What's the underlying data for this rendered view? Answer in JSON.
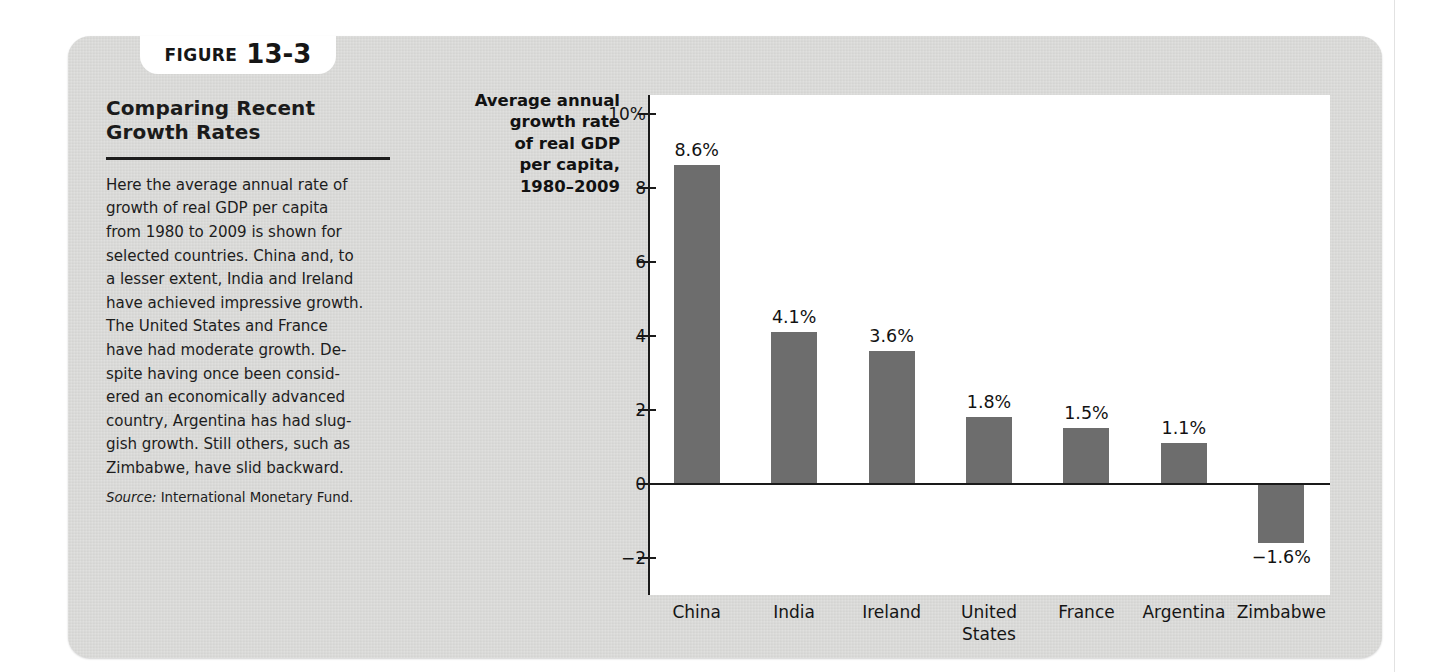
{
  "figure": {
    "tab_word": "FIGURE",
    "tab_number": "13-3",
    "title": "Comparing Recent\nGrowth Rates",
    "body": "Here the average annual rate of\ngrowth of real GDP per capita\nfrom 1980 to 2009 is shown for\nselected countries. China and, to\na lesser extent, India and Ireland\nhave achieved impressive growth.\nThe United States and France\nhave had moderate growth. De-\nspite having once been consid-\nered an economically advanced\ncountry, Argentina has had slug-\ngish growth. Still others, such as\nZimbabwe, have slid backward.",
    "source_label": "Source:",
    "source_text": " International Monetary Fund."
  },
  "colors": {
    "panel": "#d7d7d5",
    "bar": "#6d6d6d",
    "axis": "#1a1a1a",
    "plot_background": "#ffffff",
    "text": "#151515"
  },
  "chart_data": {
    "type": "bar",
    "title": "Comparing Recent Growth Rates",
    "ylabel": "Average annual\ngrowth rate\nof real GDP\nper capita,\n1980–2009",
    "xlabel": "",
    "categories": [
      "China",
      "India",
      "Ireland",
      "United\nStates",
      "France",
      "Argentina",
      "Zimbabwe"
    ],
    "values": [
      8.6,
      4.1,
      3.6,
      1.8,
      1.5,
      1.1,
      -1.6
    ],
    "value_labels": [
      "8.6%",
      "4.1%",
      "3.6%",
      "1.8%",
      "1.5%",
      "1.1%",
      "−1.6%"
    ],
    "ylim": [
      -3,
      10.5
    ],
    "yticks": [
      10,
      8,
      6,
      4,
      2,
      0,
      -2
    ],
    "ytick_labels": [
      "10%",
      "8",
      "6",
      "4",
      "2",
      "0",
      "−2"
    ],
    "grid": false,
    "legend": null,
    "source": "International Monetary Fund."
  }
}
